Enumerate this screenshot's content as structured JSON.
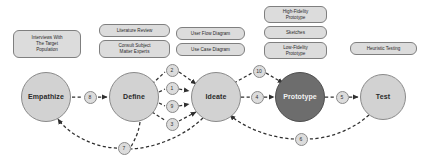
{
  "diagram": {
    "background_color": "#ffffff",
    "stage_fill": "#d2d2d2",
    "stage_fill_highlight": "#6d6d6d",
    "note_fill": "#dcdcdc",
    "badge_fill": "#dcdcdc",
    "line_color": "#3a3a3a"
  },
  "stages": [
    {
      "id": "empathize",
      "label": "Empathize",
      "cx": 46,
      "cy": 97,
      "r": 25,
      "highlight": false
    },
    {
      "id": "define",
      "label": "Define",
      "cx": 134,
      "cy": 97,
      "r": 25,
      "highlight": false
    },
    {
      "id": "ideate",
      "label": "Ideate",
      "cx": 216,
      "cy": 97,
      "r": 25,
      "highlight": false
    },
    {
      "id": "prototype",
      "label": "Prototype",
      "cx": 300,
      "cy": 97,
      "r": 25,
      "highlight": true
    },
    {
      "id": "test",
      "label": "Test",
      "cx": 383,
      "cy": 97,
      "r": 23,
      "highlight": false
    }
  ],
  "notes": [
    {
      "id": "interviews",
      "text": "Interviews With\nThe Target\nPopulation",
      "x": 13,
      "y": 30,
      "w": 68,
      "h": 28
    },
    {
      "id": "literature",
      "text": "Literature Review",
      "x": 99,
      "y": 24,
      "w": 71,
      "h": 13
    },
    {
      "id": "sme",
      "text": "Consult Subject\nMatter Experts",
      "x": 99,
      "y": 40,
      "w": 71,
      "h": 18
    },
    {
      "id": "user-flow",
      "text": "User Flow Diagram",
      "x": 176,
      "y": 27,
      "w": 69,
      "h": 13
    },
    {
      "id": "use-case",
      "text": "Use Case Diagram",
      "x": 176,
      "y": 43,
      "w": 69,
      "h": 13
    },
    {
      "id": "high-fidelity",
      "text": "High-Fidelity\nPrototype",
      "x": 264,
      "y": 6,
      "w": 63,
      "h": 17
    },
    {
      "id": "sketches",
      "text": "Sketches",
      "x": 264,
      "y": 26,
      "w": 63,
      "h": 13
    },
    {
      "id": "low-fidelity",
      "text": "Low-Fidelity\nPrototype",
      "x": 264,
      "y": 42,
      "w": 63,
      "h": 17
    },
    {
      "id": "heuristic",
      "text": "Heuristic Testing",
      "x": 350,
      "y": 42,
      "w": 67,
      "h": 13
    }
  ],
  "badges": [
    {
      "id": "badge-8",
      "label": "8",
      "cx": 90,
      "cy": 97
    },
    {
      "id": "badge-2",
      "label": "2",
      "cx": 172,
      "cy": 70
    },
    {
      "id": "badge-1",
      "label": "1",
      "cx": 172,
      "cy": 88
    },
    {
      "id": "badge-9",
      "label": "9",
      "cx": 172,
      "cy": 106
    },
    {
      "id": "badge-3",
      "label": "3",
      "cx": 172,
      "cy": 124
    },
    {
      "id": "badge-10",
      "label": "10",
      "cx": 259,
      "cy": 71
    },
    {
      "id": "badge-4",
      "label": "4",
      "cx": 257,
      "cy": 97
    },
    {
      "id": "badge-5",
      "label": "5",
      "cx": 342,
      "cy": 97
    },
    {
      "id": "badge-7",
      "label": "7",
      "cx": 124,
      "cy": 148
    },
    {
      "id": "badge-6",
      "label": "6",
      "cx": 301,
      "cy": 139
    }
  ],
  "edges": {
    "style": "dashed",
    "arrow": "triangle"
  }
}
